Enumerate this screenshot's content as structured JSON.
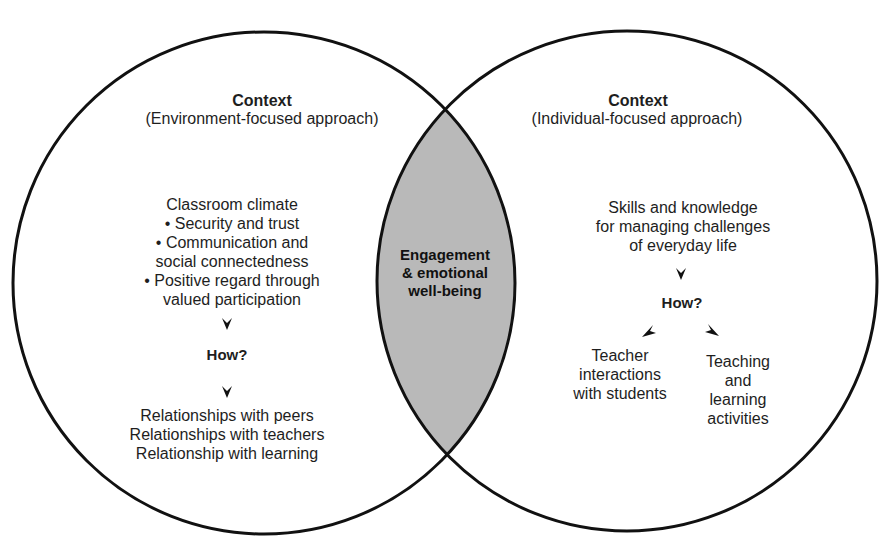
{
  "diagram": {
    "type": "venn",
    "colors": {
      "outline": "#111111",
      "overlap_fill": "#b9b9b9",
      "background": "#ffffff",
      "text": "#1e1e1e"
    },
    "left_circle": {
      "title": "Context",
      "subtitle": "(Environment-focused approach)",
      "heading": "Classroom climate",
      "bullets": [
        "• Security and trust",
        "• Communication and",
        "social connectedness",
        "• Positive regard through",
        "valued participation"
      ],
      "how": "How?",
      "outcomes": [
        "Relationships with peers",
        "Relationships with teachers",
        "Relationship with learning"
      ]
    },
    "overlap": {
      "lines": [
        "Engagement",
        "& emotional",
        "well-being"
      ]
    },
    "right_circle": {
      "title": "Context",
      "subtitle": "(Individual-focused approach)",
      "heading": [
        "Skills and knowledge",
        "for managing challenges",
        "of everyday life"
      ],
      "how": "How?",
      "branches": [
        {
          "lines": [
            "Teacher",
            "interactions",
            "with students"
          ]
        },
        {
          "lines": [
            "Teaching",
            "and",
            "learning",
            "activities"
          ]
        }
      ]
    }
  }
}
